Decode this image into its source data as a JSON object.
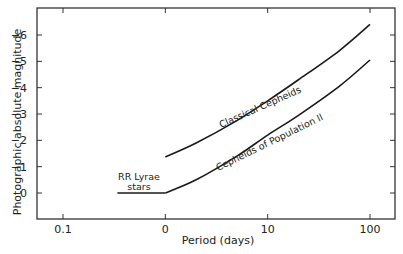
{
  "chart_data": {
    "type": "line",
    "title": "",
    "xlabel": "Period (days)",
    "ylabel": "Photographic absolute magnitude",
    "x_scale": "log",
    "x_ticks": [
      0.1,
      1,
      10,
      100
    ],
    "x_tick_labels": [
      "0.1",
      "0",
      "10",
      "100"
    ],
    "y_ticks": [
      0,
      -1,
      -2,
      -3,
      -4,
      -5,
      -6
    ],
    "y_tick_labels": [
      "0",
      "-1",
      "-2",
      "-3",
      "-4",
      "-5",
      "-6"
    ],
    "ylim": [
      0.9,
      -7.0
    ],
    "xlim": [
      0.055,
      180
    ],
    "grid": false,
    "legend": "none (inline annotations)",
    "series": [
      {
        "name": "Classical Cepheids",
        "x": [
          1,
          2,
          5,
          10,
          20,
          50,
          100
        ],
        "values": [
          -1.37,
          -1.9,
          -2.75,
          -3.5,
          -4.3,
          -5.4,
          -6.4
        ]
      },
      {
        "name": "Cepheids of Population II",
        "x": [
          1,
          2,
          5,
          10,
          20,
          50,
          100
        ],
        "values": [
          0.0,
          -0.5,
          -1.4,
          -2.2,
          -2.95,
          -4.05,
          -5.05
        ]
      },
      {
        "name": "RR Lyrae stars",
        "x": [
          0.34,
          1
        ],
        "values": [
          0.0,
          0.0
        ]
      }
    ],
    "annotations": [
      {
        "text": "Classical Cepheids",
        "along": "Classical Cepheids"
      },
      {
        "text": "Cepheids of Population II",
        "along": "Cepheids of Population II"
      },
      {
        "text": "RR Lyrae",
        "line2": "stars",
        "near": "RR Lyrae stars"
      }
    ]
  },
  "labels": {
    "x_axis": "Period (days)",
    "y_axis": "Photographic absolute magnitude",
    "classical": "Classical Cepheids",
    "pop2": "Cepheids of Population II",
    "rr1": "RR Lyrae",
    "rr2": "stars"
  },
  "colors": {
    "line": "#1a1a1a",
    "frame": "#333333",
    "text": "#222222"
  }
}
